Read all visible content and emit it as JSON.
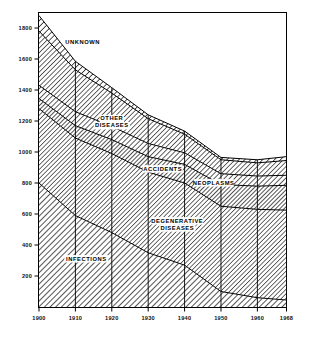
{
  "chart_data": {
    "type": "area",
    "title": "",
    "subtitle": "",
    "xlabel": "",
    "ylabel": "",
    "grid": false,
    "legend_position": "inline-labels",
    "stacked": true,
    "x": [
      1900,
      1910,
      1920,
      1930,
      1940,
      1950,
      1960,
      1968
    ],
    "xlim": [
      1900,
      1968
    ],
    "ylim": [
      0,
      1900
    ],
    "x_tick_labels": [
      "1900",
      "1910",
      "1920",
      "1930",
      "1940",
      "1950",
      "1960",
      "1968"
    ],
    "y_tick_values": [
      200,
      400,
      600,
      800,
      1000,
      1200,
      1400,
      1600,
      1800
    ],
    "y_tick_labels": [
      "200",
      "400",
      "600",
      "800",
      "1000",
      "1200",
      "1400",
      "1600",
      "1800"
    ],
    "series": [
      {
        "name": "INFECTIONS",
        "label": "INFECTIONS",
        "values": [
          800,
          590,
          480,
          350,
          270,
          100,
          60,
          45
        ]
      },
      {
        "name": "DEGENERATIVE DISEASES",
        "label": "DEGENERATIVE DISEASES",
        "values": [
          480,
          500,
          510,
          520,
          530,
          550,
          570,
          580
        ]
      },
      {
        "name": "NEOPLASMS",
        "label": "NEOPLASMS",
        "values": [
          65,
          80,
          90,
          100,
          120,
          140,
          150,
          160
        ]
      },
      {
        "name": "ACCIDENTS",
        "label": "ACCIDENTS",
        "values": [
          85,
          90,
          85,
          85,
          75,
          70,
          65,
          65
        ]
      },
      {
        "name": "OTHER DISEASES",
        "label": "OTHER DISEASES",
        "values": [
          350,
          270,
          215,
          160,
          120,
          90,
          85,
          95
        ]
      },
      {
        "name": "UNKNOWN",
        "label": "UNKNOWN",
        "values": [
          100,
          55,
          35,
          25,
          20,
          15,
          20,
          25
        ]
      }
    ],
    "totals": [
      1880,
      1585,
      1415,
      1240,
      1135,
      965,
      950,
      970
    ],
    "annotations": [
      {
        "text": "UNKNOWN",
        "x": 1912,
        "y": 1700
      },
      {
        "text": "OTHER DISEASES",
        "x": 1920,
        "y": 1205
      },
      {
        "text": "ACCIDENTS",
        "x": 1934,
        "y": 880
      },
      {
        "text": "NEOPLASMS",
        "x": 1948,
        "y": 790
      },
      {
        "text": "DEGENERATIVE DISEASES",
        "x": 1938,
        "y": 545
      },
      {
        "text": "INFECTIONS",
        "x": 1913,
        "y": 300
      }
    ]
  },
  "figure": {
    "frame_color": "#000000",
    "hatch_color": "#1a1a1a",
    "background": "#ffffff"
  }
}
